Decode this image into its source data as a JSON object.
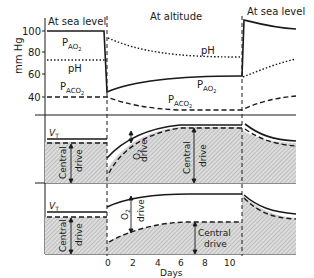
{
  "figure": {
    "phase_labels": {
      "sea_level_left": "At sea level",
      "altitude": "At altitude",
      "sea_level_right": "At sea level"
    },
    "y_axis": {
      "label": "mm Hg",
      "ticks": [
        "100",
        "80",
        "60",
        "40"
      ]
    },
    "x_axis": {
      "label": "Days",
      "ticks": [
        "0",
        "2",
        "4",
        "6",
        "8",
        "10"
      ]
    },
    "panel_top": {
      "pao2": "P",
      "pao2_sub": "AO",
      "pao2_sub2": "2",
      "ph": "pH",
      "paco2": "P",
      "paco2_sub": "ACO",
      "paco2_sub2": "2"
    },
    "panel_middle": {
      "vt": "V",
      "vt_sub": "T",
      "central": "Central",
      "drive": "drive",
      "o2": "O",
      "o2_sub": "2"
    },
    "panel_bottom": {
      "vt": "V",
      "vt_sub": "T",
      "central": "Central",
      "drive": "drive",
      "o2": "O",
      "o2_sub": "2"
    },
    "colors": {
      "ink": "#1a1a1a",
      "hatch_bg": "#d6d6d6",
      "hatch_line": "#9a9a9a"
    }
  }
}
